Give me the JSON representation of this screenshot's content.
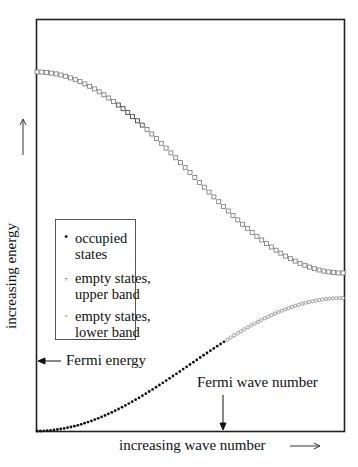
{
  "chart_data": {
    "type": "scatter",
    "title": "",
    "xlabel": "increasing wave number",
    "ylabel": "increasing energy",
    "grid": false,
    "legend_position": "inside-left",
    "series": [
      {
        "name": "occupied states",
        "marker": "filled-dot",
        "description": "lower band from k=0 up to Fermi wave number",
        "x_range": [
          0.0,
          0.62
        ],
        "y_range": [
          0.0,
          0.2
        ]
      },
      {
        "name": "empty states, upper band",
        "marker": "open-square",
        "description": "cosine-shaped band decreasing from top-left to bottom-right",
        "x_range": [
          0.0,
          1.0
        ],
        "y_range": [
          0.87,
          0.38
        ]
      },
      {
        "name": "empty states, lower band",
        "marker": "open-circle",
        "description": "lower band above Fermi wave number, rising toward band edge",
        "x_range": [
          0.62,
          1.0
        ],
        "y_range": [
          0.2,
          0.32
        ]
      }
    ],
    "annotations": [
      {
        "text": "Fermi energy",
        "arrow": "left",
        "target": "y-axis at Fermi level"
      },
      {
        "text": "Fermi wave number",
        "arrow": "down",
        "target": "x-axis at Fermi wave number"
      }
    ],
    "axis_arrows": {
      "x": "→",
      "y": "↑"
    }
  },
  "labels": {
    "ylabel": "increasing energy",
    "xlabel": "increasing wave number",
    "fermi_energy": "Fermi energy",
    "fermi_wave_number": "Fermi wave number"
  },
  "legend": {
    "items": [
      {
        "marker": "•",
        "label": "occupied\nstates"
      },
      {
        "marker": "▫",
        "label": "empty states,\nupper band"
      },
      {
        "marker": "◦",
        "label": "empty states,\nlower band"
      }
    ]
  },
  "colors": {
    "axis": "#222222",
    "occupied": "#111111",
    "empty_marker": "#666666"
  }
}
